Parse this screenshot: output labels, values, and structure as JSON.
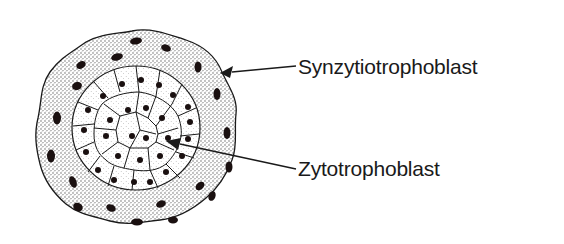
{
  "diagram": {
    "labels": [
      {
        "id": "outer",
        "text": "Synzytiotrophoblast",
        "x": 298,
        "y": 58
      },
      {
        "id": "inner",
        "text": "Zytotrophoblast",
        "x": 298,
        "y": 160
      }
    ],
    "arrows": [
      {
        "target": "outer-layer",
        "from": [
          296,
          67
        ],
        "to": [
          222,
          73
        ]
      },
      {
        "target": "inner-core",
        "from": [
          296,
          170
        ],
        "to": [
          168,
          142
        ]
      }
    ],
    "colors": {
      "outline": "#1a1a1a",
      "nucleus": "#1a1010",
      "stipple_outer": "#555555",
      "stipple_inner": "#888888",
      "background": "#ffffff",
      "text": "#1a1a1a"
    }
  }
}
